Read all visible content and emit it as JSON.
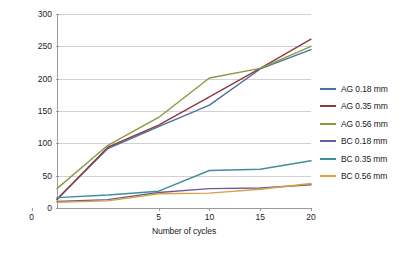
{
  "chart_data": {
    "type": "line",
    "title": "",
    "xlabel": "Number of cycles",
    "ylabel": "Weight of dust particles (g)",
    "x": [
      1,
      3,
      5,
      10,
      15,
      20
    ],
    "x_tick_labels": [
      "0",
      "5",
      "10",
      "15",
      "20"
    ],
    "x_tick_values": [
      0,
      5,
      10,
      15,
      20
    ],
    "y_tick_labels": [
      "0",
      "50",
      "100",
      "150",
      "200",
      "250",
      "300"
    ],
    "y_tick_values": [
      0,
      50,
      100,
      150,
      200,
      250,
      300
    ],
    "ylim": [
      0,
      300
    ],
    "grid": "horizontal",
    "legend_position": "right",
    "series": [
      {
        "name": "AG 0.18 mm",
        "color": "#4a6fa5",
        "values": [
          14,
          92,
          126,
          159,
          215,
          245
        ]
      },
      {
        "name": "AG 0.35 mm",
        "color": "#8d3b3b",
        "values": [
          13,
          94,
          128,
          172,
          216,
          261
        ]
      },
      {
        "name": "AG 0.56 mm",
        "color": "#8a9a3f",
        "values": [
          30,
          97,
          140,
          201,
          216,
          250
        ]
      },
      {
        "name": "BC 0.18 mm",
        "color": "#6b5b9e",
        "values": [
          10,
          13,
          24,
          30,
          31,
          36
        ]
      },
      {
        "name": "BC 0.35 mm",
        "color": "#3f8f9a",
        "values": [
          16,
          20,
          26,
          58,
          60,
          73
        ]
      },
      {
        "name": "BC 0.56 mm",
        "color": "#d9a13f",
        "values": [
          9,
          11,
          22,
          23,
          29,
          38
        ]
      }
    ]
  },
  "legend": {
    "items": [
      {
        "label": "AG 0.18 mm",
        "color": "#4a6fa5"
      },
      {
        "label": "AG 0.35 mm",
        "color": "#8d3b3b"
      },
      {
        "label": "AG 0.56 mm",
        "color": "#8a9a3f"
      },
      {
        "label": "BC 0.18 mm",
        "color": "#6b5b9e"
      },
      {
        "label": "BC 0.35 mm",
        "color": "#3f8f9a"
      },
      {
        "label": "BC 0.56 mm",
        "color": "#d9a13f"
      }
    ]
  },
  "axes": {
    "x_title": "Number of cycles",
    "y_title": "Weight of dust particles (g)"
  },
  "colors": {
    "gridline": "#d2d2d6",
    "axis": "#9a9a9e",
    "text": "#1a1a1a",
    "background": "#ffffff"
  }
}
